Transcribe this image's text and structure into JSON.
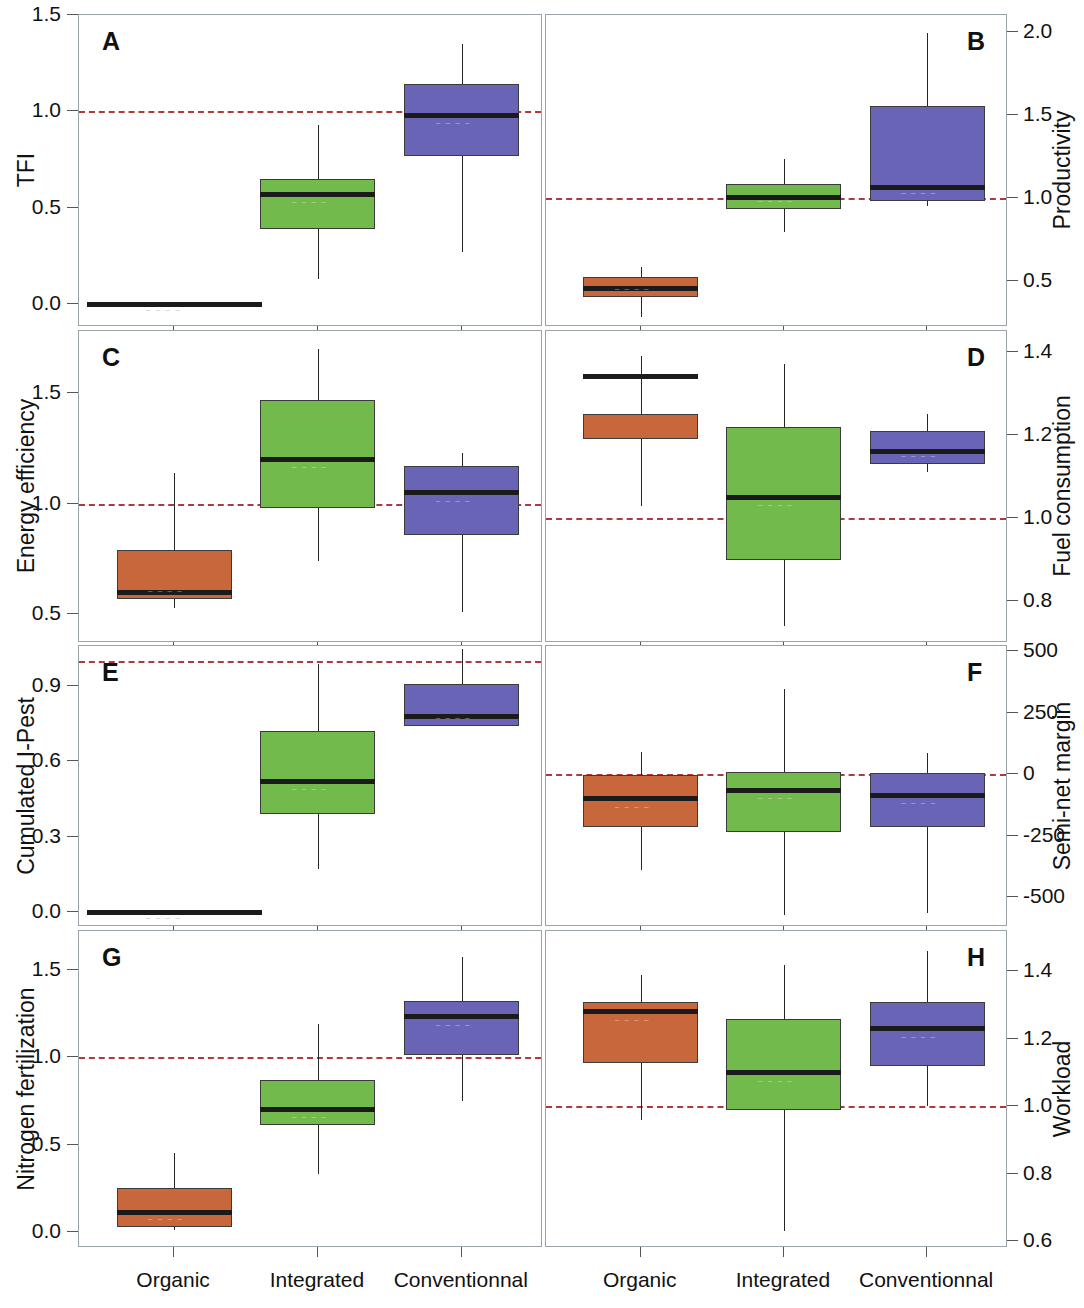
{
  "figure": {
    "categories": [
      "Organic",
      "Integrated",
      "Conventionnal"
    ],
    "colors": {
      "organic": "#c8673c",
      "integrated": "#72ba4c",
      "conventionnal": "#6a64b6",
      "reference_line": "#b03a3a"
    },
    "noise_text": "— — — —"
  },
  "chart_data": [
    {
      "type": "box",
      "panel": "A",
      "ylabel": "TFI",
      "axis_side": "left",
      "ylim": [
        -0.12,
        1.5
      ],
      "yticks": [
        0.0,
        0.5,
        1.0,
        1.5
      ],
      "yticklabels": [
        "0.0",
        "0.5",
        "1.0",
        "1.5"
      ],
      "reference_value": 1.0,
      "categories": [
        "Organic",
        "Integrated",
        "Conventionnal"
      ],
      "boxes": [
        {
          "category": "Organic",
          "color": "#c8673c",
          "whisker_low": 0.0,
          "q1": 0.0,
          "median": 0.0,
          "q3": 0.0,
          "whisker_high": 0.0,
          "degenerate": true
        },
        {
          "category": "Integrated",
          "color": "#72ba4c",
          "whisker_low": 0.13,
          "q1": 0.39,
          "median": 0.57,
          "q3": 0.65,
          "whisker_high": 0.93
        },
        {
          "category": "Conventionnal",
          "color": "#6a64b6",
          "whisker_low": 0.27,
          "q1": 0.77,
          "median": 0.98,
          "q3": 1.14,
          "whisker_high": 1.35
        }
      ]
    },
    {
      "type": "box",
      "panel": "B",
      "ylabel": "Productivity",
      "axis_side": "right",
      "ylim": [
        0.22,
        2.1
      ],
      "yticks": [
        0.5,
        1.0,
        1.5,
        2.0
      ],
      "yticklabels": [
        "0.5",
        "1.0",
        "1.5",
        "2.0"
      ],
      "reference_value": 1.0,
      "categories": [
        "Organic",
        "Integrated",
        "Conventionnal"
      ],
      "boxes": [
        {
          "category": "Organic",
          "color": "#c8673c",
          "whisker_low": 0.28,
          "q1": 0.4,
          "median": 0.45,
          "q3": 0.52,
          "whisker_high": 0.58
        },
        {
          "category": "Integrated",
          "color": "#72ba4c",
          "whisker_low": 0.79,
          "q1": 0.93,
          "median": 1.0,
          "q3": 1.08,
          "whisker_high": 1.23
        },
        {
          "category": "Conventionnal",
          "color": "#6a64b6",
          "whisker_low": 0.95,
          "q1": 0.98,
          "median": 1.06,
          "q3": 1.55,
          "whisker_high": 1.99
        }
      ]
    },
    {
      "type": "box",
      "panel": "C",
      "ylabel": "Energy efficiency",
      "axis_side": "left",
      "ylim": [
        0.37,
        1.78
      ],
      "yticks": [
        0.5,
        1.0,
        1.5
      ],
      "yticklabels": [
        "0.5",
        "1.0",
        "1.5"
      ],
      "reference_value": 1.0,
      "categories": [
        "Organic",
        "Integrated",
        "Conventionnal"
      ],
      "boxes": [
        {
          "category": "Organic",
          "color": "#c8673c",
          "whisker_low": 0.53,
          "q1": 0.57,
          "median": 0.6,
          "q3": 0.79,
          "whisker_high": 1.14
        },
        {
          "category": "Integrated",
          "color": "#72ba4c",
          "whisker_low": 0.74,
          "q1": 0.98,
          "median": 1.2,
          "q3": 1.47,
          "whisker_high": 1.7
        },
        {
          "category": "Conventionnal",
          "color": "#6a64b6",
          "whisker_low": 0.51,
          "q1": 0.86,
          "median": 1.05,
          "q3": 1.17,
          "whisker_high": 1.23
        }
      ]
    },
    {
      "type": "box",
      "panel": "D",
      "ylabel": "Fuel consumption",
      "axis_side": "right",
      "ylim": [
        0.7,
        1.45
      ],
      "yticks": [
        0.8,
        1.0,
        1.2,
        1.4
      ],
      "yticklabels": [
        "0.8",
        "1.0",
        "1.2",
        "1.4"
      ],
      "reference_value": 1.0,
      "categories": [
        "Organic",
        "Integrated",
        "Conventionnal"
      ],
      "boxes": [
        {
          "category": "Organic",
          "color": "#c8673c",
          "whisker_low": 1.03,
          "q1": 1.19,
          "median": 1.34,
          "q3": 1.25,
          "whisker_high": 1.39,
          "q1_actual": 1.19,
          "q3_actual": 1.26
        },
        {
          "category": "Integrated",
          "color": "#72ba4c",
          "whisker_low": 0.74,
          "q1": 0.9,
          "median": 1.05,
          "q3": 1.22,
          "whisker_high": 1.37
        },
        {
          "category": "Conventionnal",
          "color": "#6a64b6",
          "whisker_low": 1.11,
          "q1": 1.13,
          "median": 1.16,
          "q3": 1.21,
          "whisker_high": 1.25
        }
      ]
    },
    {
      "type": "box",
      "panel": "E",
      "ylabel": "Cumulated I-Pest",
      "axis_side": "left",
      "ylim": [
        -0.06,
        1.06
      ],
      "yticks": [
        0.0,
        0.3,
        0.6,
        0.9
      ],
      "yticklabels": [
        "0.0",
        "0.3",
        "0.6",
        "0.9"
      ],
      "reference_value": 1.0,
      "categories": [
        "Organic",
        "Integrated",
        "Conventionnal"
      ],
      "boxes": [
        {
          "category": "Organic",
          "color": "#c8673c",
          "whisker_low": 0.0,
          "q1": 0.0,
          "median": 0.0,
          "q3": 0.0,
          "whisker_high": 0.0,
          "degenerate": true
        },
        {
          "category": "Integrated",
          "color": "#72ba4c",
          "whisker_low": 0.17,
          "q1": 0.39,
          "median": 0.52,
          "q3": 0.72,
          "whisker_high": 0.99
        },
        {
          "category": "Conventionnal",
          "color": "#6a64b6",
          "whisker_low": 0.74,
          "q1": 0.74,
          "median": 0.78,
          "q3": 0.91,
          "whisker_high": 1.05
        }
      ]
    },
    {
      "type": "box",
      "panel": "F",
      "ylabel": "Semi-net margin",
      "axis_side": "right",
      "ylim": [
        -620,
        520
      ],
      "yticks": [
        -500,
        -250,
        0,
        250,
        500
      ],
      "yticklabels": [
        "-500",
        "-250",
        "0",
        "250",
        "500"
      ],
      "reference_value": 0,
      "categories": [
        "Organic",
        "Integrated",
        "Conventionnal"
      ],
      "boxes": [
        {
          "category": "Organic",
          "color": "#c8673c",
          "whisker_low": -390,
          "q1": -215,
          "median": -100,
          "q3": -5,
          "whisker_high": 90
        },
        {
          "category": "Integrated",
          "color": "#72ba4c",
          "whisker_low": -570,
          "q1": -235,
          "median": -65,
          "q3": 10,
          "whisker_high": 345
        },
        {
          "category": "Conventionnal",
          "color": "#6a64b6",
          "whisker_low": -565,
          "q1": -215,
          "median": -85,
          "q3": 5,
          "whisker_high": 85
        }
      ]
    },
    {
      "type": "box",
      "panel": "G",
      "ylabel": "Nitrogen fertilization",
      "axis_side": "left",
      "ylim": [
        -0.09,
        1.72
      ],
      "yticks": [
        0.0,
        0.5,
        1.0,
        1.5
      ],
      "yticklabels": [
        "0.0",
        "0.5",
        "1.0",
        "1.5"
      ],
      "reference_value": 1.0,
      "categories": [
        "Organic",
        "Integrated",
        "Conventionnal"
      ],
      "boxes": [
        {
          "category": "Organic",
          "color": "#c8673c",
          "whisker_low": 0.01,
          "q1": 0.03,
          "median": 0.11,
          "q3": 0.25,
          "whisker_high": 0.45
        },
        {
          "category": "Integrated",
          "color": "#72ba4c",
          "whisker_low": 0.33,
          "q1": 0.61,
          "median": 0.7,
          "q3": 0.87,
          "whisker_high": 1.19
        },
        {
          "category": "Conventionnal",
          "color": "#6a64b6",
          "whisker_low": 0.75,
          "q1": 1.01,
          "median": 1.23,
          "q3": 1.32,
          "whisker_high": 1.57
        }
      ]
    },
    {
      "type": "box",
      "panel": "H",
      "ylabel": "Workload",
      "axis_side": "right",
      "ylim": [
        0.58,
        1.52
      ],
      "yticks": [
        0.6,
        0.8,
        1.0,
        1.2,
        1.4
      ],
      "yticklabels": [
        "0.6",
        "0.8",
        "1.0",
        "1.2",
        "1.4"
      ],
      "reference_value": 1.0,
      "categories": [
        "Organic",
        "Integrated",
        "Conventionnal"
      ],
      "boxes": [
        {
          "category": "Organic",
          "color": "#c8673c",
          "whisker_low": 0.96,
          "q1": 1.13,
          "median": 1.28,
          "q3": 1.31,
          "whisker_high": 1.39
        },
        {
          "category": "Integrated",
          "color": "#72ba4c",
          "whisker_low": 0.63,
          "q1": 0.99,
          "median": 1.1,
          "q3": 1.26,
          "whisker_high": 1.42
        },
        {
          "category": "Conventionnal",
          "color": "#6a64b6",
          "whisker_low": 1.0,
          "q1": 1.12,
          "median": 1.23,
          "q3": 1.31,
          "whisker_high": 1.46
        }
      ]
    }
  ]
}
